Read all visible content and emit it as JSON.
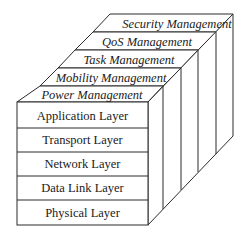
{
  "diagram": {
    "management_planes": [
      {
        "label": "Security Management"
      },
      {
        "label": "QoS Management"
      },
      {
        "label": "Task Management"
      },
      {
        "label": "Mobility Management"
      },
      {
        "label": "Power Management"
      }
    ],
    "protocol_layers": [
      {
        "label": "Application Layer"
      },
      {
        "label": "Transport Layer"
      },
      {
        "label": "Network Layer"
      },
      {
        "label": "Data Link Layer"
      },
      {
        "label": "Physical Layer"
      }
    ],
    "colors": {
      "stroke": "#2a2a2a",
      "text": "#1a1a1a",
      "background": "#ffffff"
    }
  }
}
